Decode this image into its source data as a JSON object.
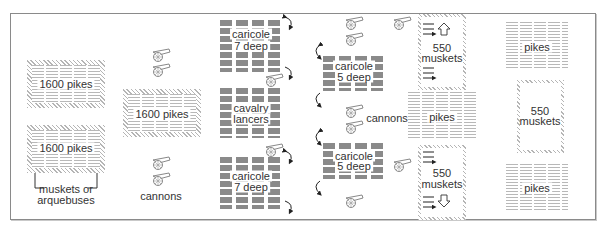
{
  "diagram": {
    "type": "battle-formation",
    "colors": {
      "frame": "#8a8a8a",
      "ink": "#333333",
      "hatch": "#b5b5b5",
      "cavalry": "#8a8a8a"
    },
    "left_formation": {
      "pike_block_top": {
        "label": "1600 pikes"
      },
      "pike_block_bottom": {
        "label": "1600 pikes"
      },
      "bracket_label_line1": "muskets or",
      "bracket_label_line2": "arquebuses",
      "center_pike_block": {
        "label": "1600 pikes"
      },
      "cannons_label": "cannons"
    },
    "cavalry": {
      "left_top": {
        "line1": "caricole",
        "line2": "7 deep"
      },
      "left_middle": {
        "line1": "cavalry",
        "line2": "lancers"
      },
      "left_bottom": {
        "line1": "caricole",
        "line2": "7 deep"
      },
      "right_top": {
        "line1": "caricole",
        "line2": "5 deep"
      },
      "right_bottom": {
        "line1": "caricole",
        "line2": "5 deep"
      },
      "cannons_label": "cannons"
    },
    "right_formation": {
      "musket_box_top": {
        "line1": "550",
        "line2": "muskets"
      },
      "middle_pikes": {
        "label": "pikes"
      },
      "musket_box_bottom": {
        "line1": "550",
        "line2": "muskets"
      },
      "far_pikes_top": {
        "label": "pikes"
      },
      "far_musket_box": {
        "line1": "550",
        "line2": "muskets"
      },
      "far_pikes_bottom": {
        "label": "pikes"
      }
    }
  }
}
